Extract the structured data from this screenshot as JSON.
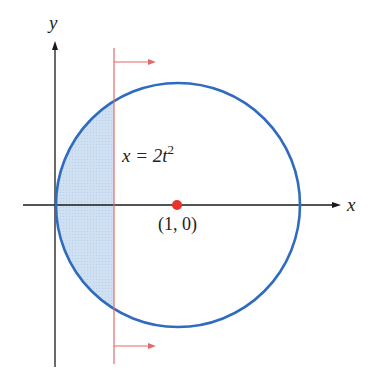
{
  "figure": {
    "axes": {
      "x_label": "x",
      "y_label": "y",
      "color": "#1a1a1a"
    },
    "circle": {
      "center_label": "(1, 0)",
      "center_point": [
        1,
        0
      ],
      "radius": 1,
      "color": "#2f6bbf"
    },
    "center_dot": {
      "color": "#e8322b"
    },
    "vertical_line": {
      "equation_prefix": "x = 2t",
      "equation_exponent": "2",
      "color": "#e36a6a",
      "arrow_direction": "right"
    },
    "shaded_region": {
      "description": "circle segment between y-axis and line x = 2t^2",
      "fill": "#c9dcf0"
    }
  }
}
